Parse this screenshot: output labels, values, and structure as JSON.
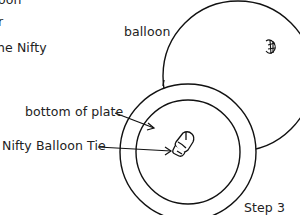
{
  "instructions_fragment": {
    "line1": "oon",
    "line2": "r",
    "line3": "he Nifty"
  },
  "labels": {
    "balloon": "balloon",
    "bottom_of_plate": "bottom of plate",
    "nifty_balloon_tie": "Nifty Balloon Tie",
    "step": "Step 3"
  },
  "colors": {
    "stroke": "#111111",
    "text": "#222222",
    "background": "#ffffff"
  }
}
